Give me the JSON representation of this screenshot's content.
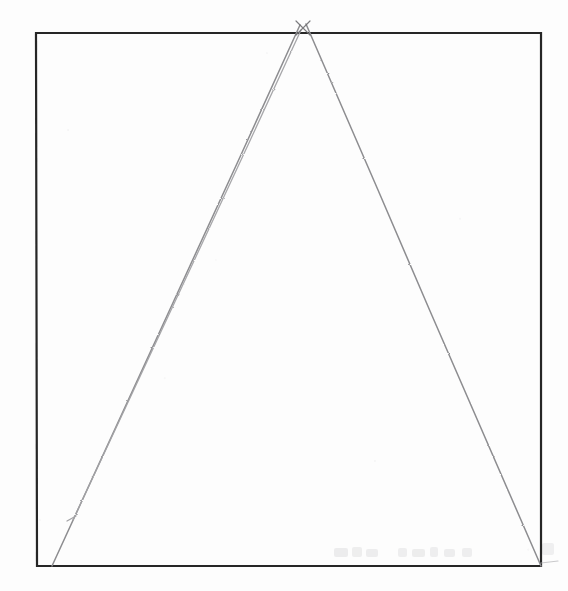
{
  "figure": {
    "medium": "pencil-on-paper scan",
    "background_color": "#fdfdfd",
    "canvas": {
      "width": 568,
      "height": 591
    }
  },
  "chart_data": {
    "type": "diagram",
    "coordinate_space": {
      "x": [
        0,
        568
      ],
      "y": [
        0,
        591
      ],
      "origin": "top-left"
    },
    "shapes": [
      {
        "name": "square-frame",
        "kind": "rectangle",
        "stroke_color": "#262626",
        "stroke_width": 2.2,
        "fill": "none",
        "corners": {
          "top_left": [
            36,
            33
          ],
          "top_right": [
            541,
            33
          ],
          "bottom_right": [
            541,
            566
          ],
          "bottom_left": [
            37,
            566
          ]
        },
        "width": 505,
        "height": 533
      },
      {
        "name": "triangle-left-leg",
        "kind": "line",
        "stroke_color": "#8d8d90",
        "stroke_width": 1.5,
        "from": [
          52,
          566
        ],
        "to": [
          300,
          25
        ],
        "note": "apex tail overshoots the top border"
      },
      {
        "name": "triangle-right-leg",
        "kind": "line",
        "stroke_color": "#8d8d90",
        "stroke_width": 1.5,
        "from": [
          541,
          566
        ],
        "to": [
          306,
          24
        ],
        "note": "apex tail overshoots the top border"
      },
      {
        "name": "triangle-left-leg-duplicate",
        "kind": "line",
        "stroke_color": "#a3a3a6",
        "stroke_width": 1.3,
        "from": [
          73,
          520
        ],
        "to": [
          301,
          30
        ],
        "note": "faint second parallel stroke that stops short of the base"
      },
      {
        "name": "duplicate-leg-end-tick",
        "kind": "line",
        "stroke_color": "#a3a3a6",
        "stroke_width": 1.3,
        "from": [
          67,
          521
        ],
        "to": [
          76,
          516
        ]
      },
      {
        "name": "baseline-left-overshoot",
        "kind": "line",
        "stroke_color": "#9d9da0",
        "stroke_width": 1.4,
        "from": [
          12,
          566
        ],
        "to": [
          37,
          566
        ]
      },
      {
        "name": "baseline-right-overshoot",
        "kind": "line",
        "stroke_color": "#b4b4b7",
        "stroke_width": 1.2,
        "from": [
          541,
          563
        ],
        "to": [
          558,
          561
        ]
      }
    ],
    "apex": {
      "name": "triangle-apex",
      "point": [
        303,
        28
      ],
      "description": "the two legs cross just above the top border forming a small X"
    },
    "base": {
      "name": "triangle-base",
      "from": [
        52,
        566
      ],
      "to": [
        541,
        566
      ],
      "coincides_with": "square-frame bottom edge"
    },
    "artifacts": [
      {
        "name": "bleed-through-text",
        "kind": "faint-ghost-text",
        "region": [
          330,
          545,
          210,
          18
        ],
        "legible": false,
        "note": "illegible show-through from the reverse of the sheet"
      }
    ],
    "legend": [],
    "grid": false,
    "labels": []
  }
}
